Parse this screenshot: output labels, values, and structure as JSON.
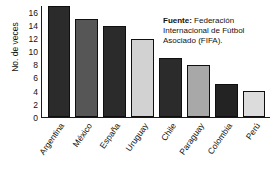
{
  "chart_data": {
    "type": "bar",
    "title": "",
    "xlabel": "",
    "ylabel": "No. de veces",
    "ylim": [
      0,
      17
    ],
    "yticks": [
      16,
      14,
      12,
      10,
      8,
      6,
      4,
      2,
      0
    ],
    "grid": false,
    "legend": null,
    "categories": [
      "Argentina",
      "México",
      "España",
      "Uruguay",
      "Chile",
      "Paraguay",
      "Colombia",
      "Perú"
    ],
    "values": [
      17,
      15,
      14,
      12,
      9,
      8,
      5,
      4
    ],
    "bar_colors": [
      "#2b2b2b",
      "#565656",
      "#2b2b2b",
      "#d2d2d2",
      "#2b2b2b",
      "#a8a8a8",
      "#232323",
      "#dcdcdc"
    ]
  },
  "annotations": {
    "source": {
      "label": "Fuente:",
      "text": " Federación Internacional de Fútbol Asociado (FIFA)."
    }
  },
  "colors": {
    "axis": "#1a1a1a",
    "text": "#111111",
    "background": "#ffffff"
  }
}
